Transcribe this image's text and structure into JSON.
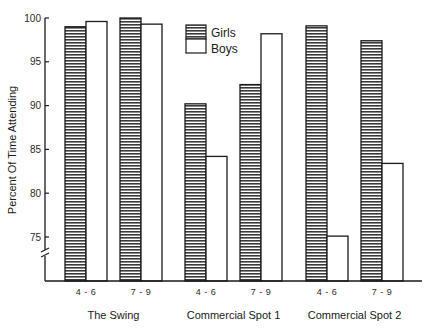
{
  "chart_data": {
    "type": "bar",
    "title": "",
    "xlabel": "",
    "ylabel": "Percent Of Time Attending",
    "ylim": [
      72,
      100
    ],
    "yticks": [
      75,
      80,
      85,
      90,
      95,
      100
    ],
    "axis_break": true,
    "grid": false,
    "legend_position": "top-center",
    "groups": [
      {
        "label": "The Swing",
        "categories": [
          "4-6",
          "7-9"
        ]
      },
      {
        "label": "Commercial Spot 1",
        "categories": [
          "4-6",
          "7-9"
        ]
      },
      {
        "label": "Commercial Spot 2",
        "categories": [
          "4-6",
          "7-9"
        ]
      }
    ],
    "categories": [
      "The Swing 4-6",
      "The Swing 7-9",
      "Commercial Spot 1 4-6",
      "Commercial Spot 1 7-9",
      "Commercial Spot 2 4-6",
      "Commercial Spot 2 7-9"
    ],
    "series": [
      {
        "name": "Girls",
        "pattern": "horizontal-hatch",
        "values": [
          99.0,
          100.0,
          90.2,
          92.4,
          99.1,
          97.4
        ]
      },
      {
        "name": "Boys",
        "pattern": "open",
        "values": [
          99.6,
          99.3,
          84.2,
          98.2,
          75.1,
          83.4
        ]
      }
    ]
  },
  "colors": {
    "ink": "#1a1a1a",
    "hatch": "#3a3a3a",
    "background": "#ffffff"
  }
}
